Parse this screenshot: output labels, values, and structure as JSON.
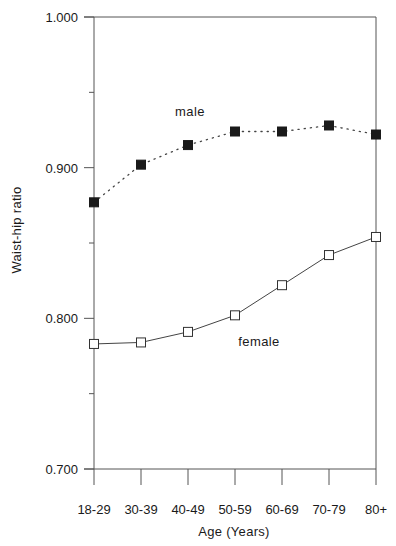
{
  "chart_data": {
    "type": "line",
    "title": "",
    "xlabel": "Age (Years)",
    "ylabel": "Waist-hip ratio",
    "categories": [
      "18-29",
      "30-39",
      "40-49",
      "50-59",
      "60-69",
      "70-79",
      "80+"
    ],
    "series": [
      {
        "name": "male",
        "marker": "filled-square",
        "line_style": "dotted",
        "color": "#1a1a1a",
        "values": [
          0.877,
          0.902,
          0.915,
          0.924,
          0.924,
          0.928,
          0.922
        ]
      },
      {
        "name": "female",
        "marker": "open-square",
        "line_style": "solid",
        "color": "#1a1a1a",
        "values": [
          0.783,
          0.784,
          0.791,
          0.802,
          0.822,
          0.842,
          0.854
        ]
      }
    ],
    "ylim": [
      0.7,
      1.0
    ],
    "yticks": [
      "1.000",
      "0.900",
      "0.800",
      "0.700"
    ],
    "yticks_values": [
      1.0,
      0.9,
      0.8,
      0.7
    ],
    "minor_yticks_values": [
      0.95,
      0.85,
      0.75
    ],
    "grid": false,
    "legend_position": "inline-labels",
    "annotations": [
      {
        "text": "male",
        "x": 190,
        "y": 116
      },
      {
        "text": "female",
        "x": 259,
        "y": 346
      }
    ]
  }
}
